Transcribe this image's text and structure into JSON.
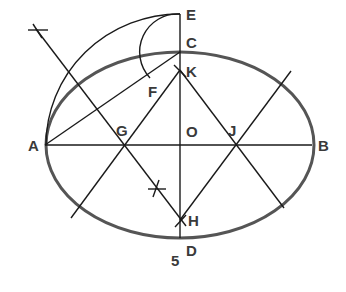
{
  "figure": {
    "number": "5",
    "colors": {
      "ellipse": "#555555",
      "lines": "#1a1a1a",
      "labels": "#3a3a3a"
    }
  },
  "points": {
    "A": {
      "label": "A",
      "x": 45,
      "y": 145
    },
    "B": {
      "label": "B",
      "x": 312,
      "y": 145
    },
    "C": {
      "label": "C",
      "x": 180,
      "y": 52
    },
    "D": {
      "label": "D",
      "x": 180,
      "y": 238
    },
    "E": {
      "label": "E",
      "x": 180,
      "y": 14
    },
    "F": {
      "label": "F",
      "x": 148,
      "y": 76
    },
    "G": {
      "label": "G",
      "x": 124,
      "y": 145
    },
    "H": {
      "label": "H",
      "x": 180,
      "y": 220
    },
    "J": {
      "label": "J",
      "x": 236,
      "y": 145
    },
    "K": {
      "label": "K",
      "x": 180,
      "y": 70
    },
    "O": {
      "label": "O",
      "x": 180,
      "y": 145
    }
  }
}
